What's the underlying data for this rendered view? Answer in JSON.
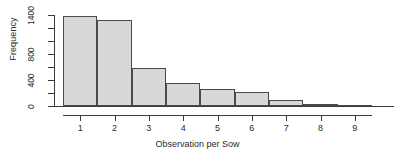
{
  "chart_data": {
    "type": "bar",
    "title": "",
    "subtitle": "",
    "xlabel": "Observation per Sow",
    "ylabel": "Frequency",
    "categories": [
      "1",
      "2",
      "3",
      "4",
      "5",
      "6",
      "7",
      "8",
      "9"
    ],
    "values": [
      1390,
      1330,
      585,
      355,
      265,
      215,
      90,
      35,
      12
    ],
    "xlim": [
      0.5,
      9.5
    ],
    "ylim": [
      0,
      1400
    ],
    "xticks": [
      "1",
      "2",
      "3",
      "4",
      "5",
      "6",
      "7",
      "8",
      "9"
    ],
    "yticks": [
      0,
      200,
      400,
      600,
      800,
      1000,
      1200,
      1400
    ],
    "ytick_labels": [
      "0",
      "",
      "400",
      "",
      "800",
      "",
      "",
      "1400"
    ],
    "grid": false,
    "legend": null,
    "bar_fill_color": "#d8d8d8",
    "bar_border_color": "#4a4a4a",
    "axis_color": "#3a3a3a",
    "text_color": "#2b2b2b"
  },
  "axes": {
    "y": {
      "title": "Frequency",
      "ticks": [
        {
          "value": 1400,
          "label": "1400"
        },
        {
          "value": 1200,
          "label": ""
        },
        {
          "value": 1000,
          "label": ""
        },
        {
          "value": 800,
          "label": "800"
        },
        {
          "value": 600,
          "label": ""
        },
        {
          "value": 400,
          "label": "400"
        },
        {
          "value": 200,
          "label": ""
        },
        {
          "value": 0,
          "label": "0"
        }
      ]
    },
    "x": {
      "title": "Observation per Sow",
      "ticks": [
        {
          "value": 1,
          "label": "1"
        },
        {
          "value": 2,
          "label": "2"
        },
        {
          "value": 3,
          "label": "3"
        },
        {
          "value": 4,
          "label": "4"
        },
        {
          "value": 5,
          "label": "5"
        },
        {
          "value": 6,
          "label": "6"
        },
        {
          "value": 7,
          "label": "7"
        },
        {
          "value": 8,
          "label": "8"
        },
        {
          "value": 9,
          "label": "9"
        }
      ]
    }
  }
}
